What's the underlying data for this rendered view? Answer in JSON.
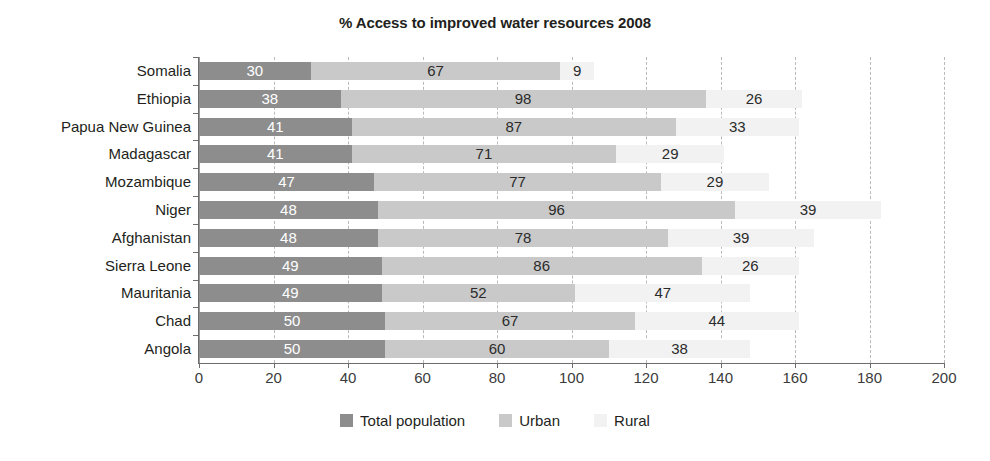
{
  "chart_data": {
    "type": "bar",
    "orientation": "horizontal",
    "stacked": true,
    "title": "% Access to improved water resources 2008",
    "xlabel": "",
    "ylabel": "",
    "xlim": [
      0,
      200
    ],
    "xticks": [
      0,
      20,
      40,
      60,
      80,
      100,
      120,
      140,
      160,
      180,
      200
    ],
    "xtick_labels": [
      "0",
      "20",
      "40",
      "60",
      "80",
      "100",
      "120",
      "140",
      "160",
      "180",
      "200"
    ],
    "grid": true,
    "grid_axis": "x",
    "legend_position": "bottom",
    "categories": [
      "Somalia",
      "Ethiopia",
      "Papua New Guinea",
      "Madagascar",
      "Mozambique",
      "Niger",
      "Afghanistan",
      "Sierra Leone",
      "Mauritania",
      "Chad",
      "Angola"
    ],
    "series": [
      {
        "name": "Total population",
        "color": "#8d8d8d",
        "values": [
          30,
          38,
          41,
          41,
          47,
          48,
          48,
          49,
          49,
          50,
          50
        ]
      },
      {
        "name": "Urban",
        "color": "#c9c9c9",
        "values": [
          67,
          98,
          87,
          71,
          77,
          96,
          78,
          86,
          52,
          67,
          60
        ]
      },
      {
        "name": "Rural",
        "color": "#f2f2f2",
        "values": [
          9,
          26,
          33,
          29,
          29,
          39,
          39,
          26,
          47,
          44,
          38
        ]
      }
    ]
  },
  "legend": {
    "items": [
      {
        "label": "Total population",
        "color": "#8d8d8d"
      },
      {
        "label": "Urban",
        "color": "#c9c9c9"
      },
      {
        "label": "Rural",
        "color": "#f2f2f2"
      }
    ]
  }
}
